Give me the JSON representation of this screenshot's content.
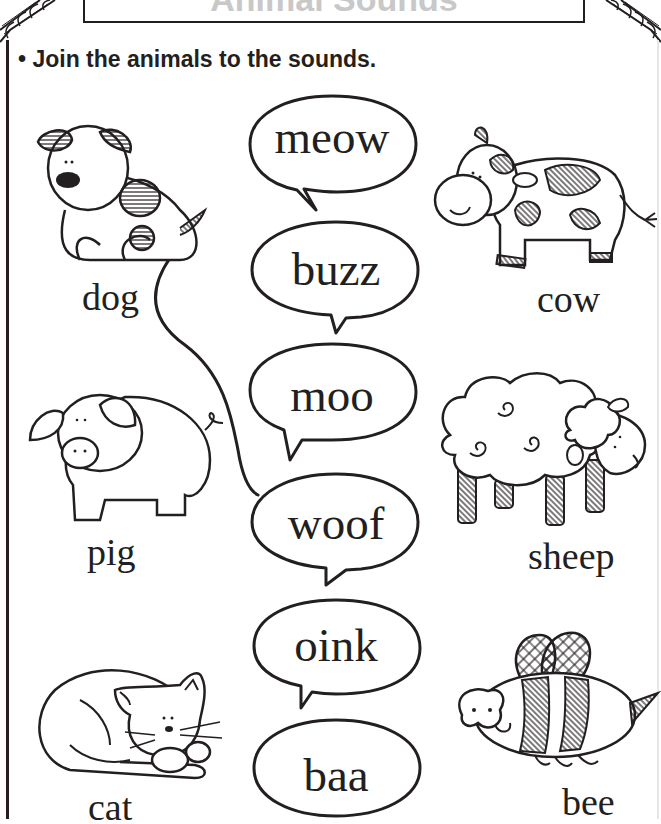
{
  "worksheet": {
    "title": "Animal Sounds",
    "instruction": "• Join the animals to the sounds."
  },
  "animals": [
    {
      "id": "dog",
      "label": "dog",
      "icon": "dog-icon"
    },
    {
      "id": "cow",
      "label": "cow",
      "icon": "cow-icon"
    },
    {
      "id": "pig",
      "label": "pig",
      "icon": "pig-icon"
    },
    {
      "id": "sheep",
      "label": "sheep",
      "icon": "sheep-icon"
    },
    {
      "id": "cat",
      "label": "cat",
      "icon": "cat-icon"
    },
    {
      "id": "bee",
      "label": "bee",
      "icon": "bee-icon"
    }
  ],
  "sounds": [
    {
      "id": "meow",
      "label": "meow"
    },
    {
      "id": "buzz",
      "label": "buzz"
    },
    {
      "id": "moo",
      "label": "moo"
    },
    {
      "id": "woof",
      "label": "woof"
    },
    {
      "id": "oink",
      "label": "oink"
    },
    {
      "id": "baa",
      "label": "baa"
    }
  ],
  "connections": [
    {
      "from": "dog",
      "to": "woof"
    }
  ],
  "colors": {
    "ink": "#231f20",
    "background": "#ffffff"
  }
}
